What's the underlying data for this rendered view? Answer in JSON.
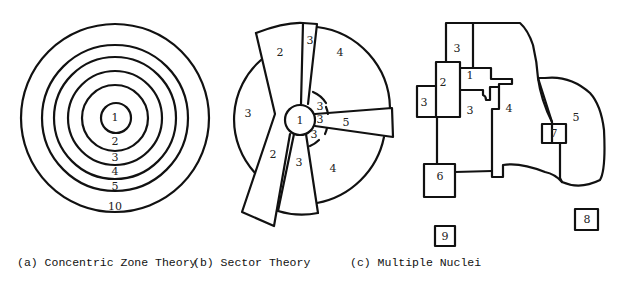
{
  "captions": {
    "a": "(a) Concentric Zone Theory",
    "b": "(b) Sector Theory",
    "c": "(c) Multiple Nuclei"
  },
  "concentric": {
    "zones": [
      "1",
      "2",
      "3",
      "4",
      "5",
      "10"
    ]
  },
  "sector": {
    "labels": {
      "center": "1",
      "top_left_wedge": "2",
      "top_narrow": "3",
      "top_right": "4",
      "left": "3",
      "bottom_left_wedge": "2",
      "bottom_narrow": "3",
      "bottom_right": "4",
      "right_wedge": "5",
      "inner_upper": "3",
      "inner_mid": "3",
      "inner_lower": "3"
    }
  },
  "nuclei": {
    "labels": {
      "cbd": "1",
      "wholesale": "2",
      "top_res": "3",
      "left_res": "3",
      "mid_res": "3",
      "middle": "4",
      "outer": "5",
      "n6": "6",
      "n7": "7",
      "n8": "8",
      "n9": "9"
    }
  }
}
